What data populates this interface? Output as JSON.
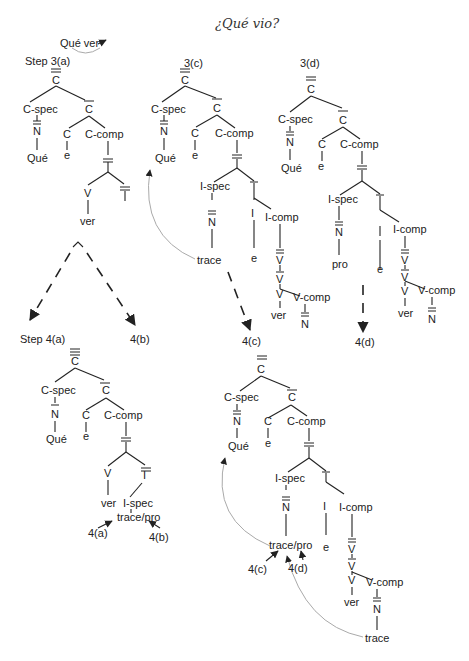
{
  "title": "¿Qué vio?",
  "annotations": {
    "que_ver": "Qué ver",
    "step3a": "Step  3(a)",
    "step3c": "3(c)",
    "step3d": "3(d)",
    "step4a": "Step 4(a)",
    "step4b": "4(b)",
    "step4c": "4(c)",
    "step4d": "4(d)",
    "arrow4a": "4(a)",
    "arrow4b": "4(b)",
    "arrow4c": "4(c)",
    "arrow4d": "4(d)"
  },
  "nodes": {
    "C": "C",
    "Cspec": "C-spec",
    "Ccomp": "C-comp",
    "N": "N",
    "Que": "Qué",
    "e": "e",
    "V": "V",
    "ver": "ver",
    "I": "I",
    "Ispec": "I-spec",
    "Icomp": "I-comp",
    "Vcomp": "V-comp",
    "trace": "trace",
    "pro": "pro",
    "tracepro": "trace/pro"
  }
}
